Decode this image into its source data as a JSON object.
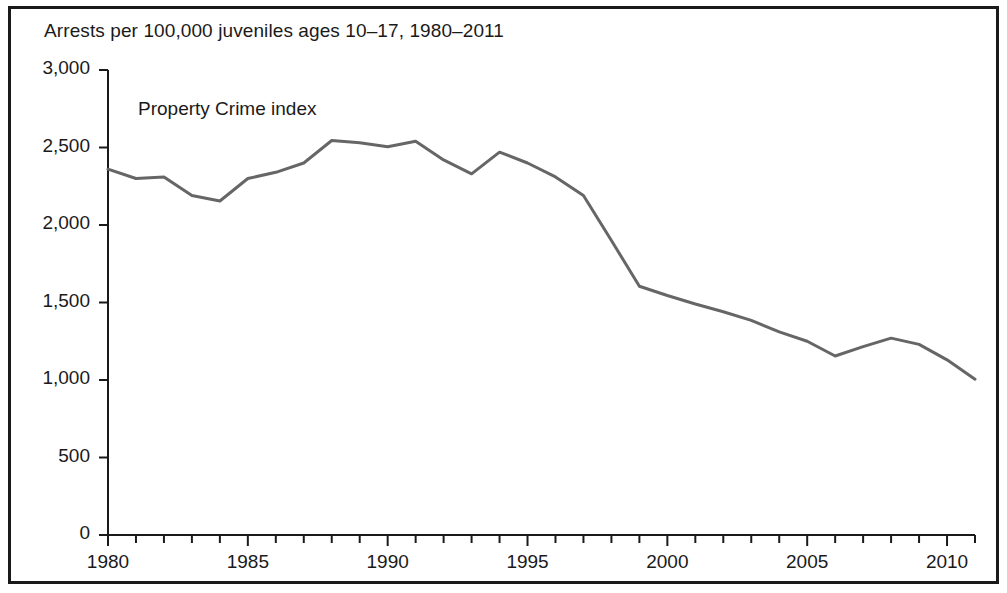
{
  "figure": {
    "title": "Arrests per 100,000 juveniles ages 10–17, 1980–2011",
    "border_color": "#1a1a1a",
    "background_color": "#ffffff"
  },
  "chart_data": {
    "type": "line",
    "title": "Arrests per 100,000 juveniles ages 10–17, 1980–2011",
    "subtitle": "",
    "xlabel": "",
    "ylabel": "",
    "annotations": [
      {
        "text": "Property Crime index",
        "x": 1982,
        "y": 2780
      }
    ],
    "legend": {
      "position": "inside-top-left",
      "entries": [
        "Property Crime index"
      ]
    },
    "grid": false,
    "xlim": [
      1980,
      2011
    ],
    "ylim": [
      0,
      3000
    ],
    "ytick_values": [
      0,
      500,
      1000,
      1500,
      2000,
      2500,
      3000
    ],
    "ytick_labels": [
      "0",
      "500",
      "1,000",
      "1,500",
      "2,000",
      "2,500",
      "3,000"
    ],
    "xtick_labels": [
      "1980",
      "1985",
      "1990",
      "1995",
      "2000",
      "2005",
      "2010"
    ],
    "xtick_values": [
      1980,
      1985,
      1990,
      1995,
      2000,
      2005,
      2010
    ],
    "xtick_minor_step": 1,
    "line_color": "#666666",
    "line_width": 3,
    "series": [
      {
        "name": "Property Crime index",
        "x": [
          1980,
          1981,
          1982,
          1983,
          1984,
          1985,
          1986,
          1987,
          1988,
          1989,
          1990,
          1991,
          1992,
          1993,
          1994,
          1995,
          1996,
          1997,
          1998,
          1999,
          2000,
          2001,
          2002,
          2003,
          2004,
          2005,
          2006,
          2007,
          2008,
          2009,
          2010,
          2011
        ],
        "values": [
          2360,
          2300,
          2310,
          2190,
          2155,
          2300,
          2340,
          2400,
          2545,
          2530,
          2505,
          2540,
          2420,
          2330,
          2470,
          2400,
          2310,
          2190,
          1900,
          1605,
          1545,
          1490,
          1440,
          1385,
          1310,
          1250,
          1155,
          1215,
          1270,
          1230,
          1130,
          1005
        ]
      }
    ]
  }
}
